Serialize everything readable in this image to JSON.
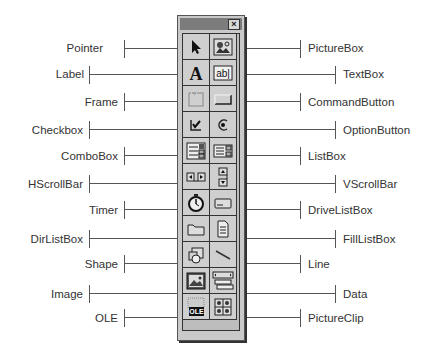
{
  "toolbox": {
    "close_label": "×",
    "tools": [
      {
        "name": "Pointer",
        "icon": "pointer-arrow-icon",
        "side": "left"
      },
      {
        "name": "PictureBox",
        "icon": "picturebox-icon",
        "side": "right"
      },
      {
        "name": "Label",
        "icon": "label-a-icon",
        "side": "left"
      },
      {
        "name": "TextBox",
        "icon": "textbox-ab-icon",
        "side": "right"
      },
      {
        "name": "Frame",
        "icon": "frame-icon",
        "side": "left"
      },
      {
        "name": "CommandButton",
        "icon": "command-button-icon",
        "side": "right"
      },
      {
        "name": "Checkbox",
        "icon": "checkbox-icon",
        "side": "left"
      },
      {
        "name": "OptionButton",
        "icon": "option-button-icon",
        "side": "right"
      },
      {
        "name": "ComboBox",
        "icon": "combobox-icon",
        "side": "left"
      },
      {
        "name": "ListBox",
        "icon": "listbox-icon",
        "side": "right"
      },
      {
        "name": "HScrollBar",
        "icon": "hscrollbar-icon",
        "side": "left"
      },
      {
        "name": "VScrollBar",
        "icon": "vscrollbar-icon",
        "side": "right"
      },
      {
        "name": "Timer",
        "icon": "timer-stopwatch-icon",
        "side": "left"
      },
      {
        "name": "DriveListBox",
        "icon": "drive-icon",
        "side": "right"
      },
      {
        "name": "DirListBox",
        "icon": "folder-icon",
        "side": "left"
      },
      {
        "name": "FillListBox",
        "icon": "file-icon",
        "side": "right"
      },
      {
        "name": "Shape",
        "icon": "shape-icon",
        "side": "left"
      },
      {
        "name": "Line",
        "icon": "line-icon",
        "side": "right"
      },
      {
        "name": "Image",
        "icon": "image-icon",
        "side": "left"
      },
      {
        "name": "Data",
        "icon": "data-control-icon",
        "side": "right"
      },
      {
        "name": "OLE",
        "icon": "ole-icon",
        "side": "left"
      },
      {
        "name": "PictureClip",
        "icon": "pictureclip-icon",
        "side": "right"
      }
    ],
    "ole_text": "OLE"
  },
  "labels": {
    "left": [
      "Pointer",
      "Label",
      "Frame",
      "Checkbox",
      "ComboBox",
      "HScrollBar",
      "Timer",
      "DirListBox",
      "Shape",
      "Image",
      "OLE"
    ],
    "right": [
      "PictureBox",
      "TextBox",
      "CommandButton",
      "OptionButton",
      "ListBox",
      "VScrollBar",
      "DriveListBox",
      "FillListBox",
      "Line",
      "Data",
      "PictureClip"
    ]
  }
}
